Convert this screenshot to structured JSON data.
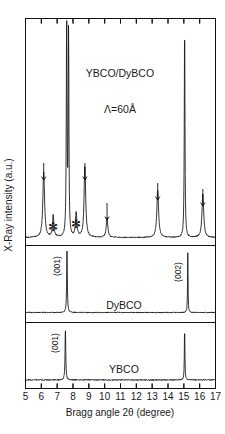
{
  "figure": {
    "ylabel": "X-Ray intensity  (a.u.)",
    "xlabel": "Bragg angle 2θ  (degree)"
  },
  "chart_data": {
    "type": "line",
    "title": "",
    "xlabel": "Bragg angle 2θ  (degree)",
    "ylabel": "X-Ray intensity  (a.u.)",
    "xlim": [
      5,
      17
    ],
    "xticks": [
      5,
      6,
      7,
      8,
      9,
      10,
      11,
      12,
      13,
      14,
      15,
      16,
      17
    ],
    "xticklabels": [
      "5",
      "6",
      "7",
      "8",
      "9",
      "10",
      "11",
      "12",
      "13",
      "14",
      "15",
      "16",
      "17"
    ],
    "grid": false,
    "legend": "none",
    "panels": [
      {
        "name": "superlattice",
        "label": "YBCO/DyBCO",
        "sublabel": "Λ=60Å",
        "peaks": [
          {
            "x": 6.15,
            "height": 0.3,
            "width": 0.13,
            "kind": "satellite",
            "marker": "arrow"
          },
          {
            "x": 6.75,
            "height": 0.1,
            "width": 0.11,
            "kind": "impurity",
            "marker": "asterisk"
          },
          {
            "x": 7.6,
            "height": 1.0,
            "width": 0.055,
            "kind": "main",
            "marker": "none"
          },
          {
            "x": 7.72,
            "height": 0.95,
            "width": 0.05,
            "kind": "main",
            "marker": "none"
          },
          {
            "x": 8.2,
            "height": 0.11,
            "width": 0.11,
            "kind": "impurity",
            "marker": "asterisk"
          },
          {
            "x": 8.75,
            "height": 0.33,
            "width": 0.12,
            "kind": "satellite",
            "marker": "arrow"
          },
          {
            "x": 10.15,
            "height": 0.09,
            "width": 0.12,
            "kind": "satellite",
            "marker": "arrow"
          },
          {
            "x": 13.35,
            "height": 0.22,
            "width": 0.13,
            "kind": "satellite",
            "marker": "arrow"
          },
          {
            "x": 15.05,
            "height": 1.0,
            "width": 0.05,
            "kind": "main",
            "marker": "none"
          },
          {
            "x": 16.2,
            "height": 0.2,
            "width": 0.13,
            "kind": "satellite",
            "marker": "arrow"
          }
        ],
        "markers": {
          "arrow": [
            6.15,
            8.75,
            10.15,
            13.35,
            16.2
          ],
          "asterisk": [
            6.75,
            8.2
          ]
        }
      },
      {
        "name": "dybco",
        "label": "DyBCO",
        "peaks": [
          {
            "x": 7.62,
            "height": 1.0,
            "width": 0.05,
            "index": "(001)"
          },
          {
            "x": 15.25,
            "height": 1.0,
            "width": 0.035,
            "index": "(002)"
          }
        ],
        "peak_labels": [
          {
            "text": "(001)",
            "x": 7.62
          },
          {
            "text": "(002)",
            "x": 15.25
          }
        ]
      },
      {
        "name": "ybco",
        "label": "YBCO",
        "peaks": [
          {
            "x": 7.52,
            "height": 1.0,
            "width": 0.05,
            "index": "(001)"
          },
          {
            "x": 15.05,
            "height": 1.0,
            "width": 0.04,
            "index": "(002)"
          }
        ],
        "peak_labels": [
          {
            "text": "(001)",
            "x": 7.52
          }
        ]
      }
    ]
  }
}
